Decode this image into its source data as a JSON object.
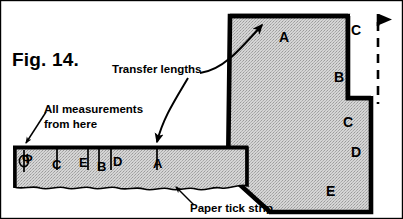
{
  "figure": {
    "title": "Fig. 14.",
    "domain_kind": "technical-illustration"
  },
  "colors": {
    "ink": "#000000",
    "paper": "#ffffff",
    "fill_hatch": "#c9c9c9",
    "fill_strip": "#cfcfcf"
  },
  "annotations": {
    "transfer_lengths": "Transfer lengths",
    "all_measurements": "All measurements",
    "from_here": "from here",
    "paper_tick_strip": "Paper tick strip"
  },
  "tick_strip": {
    "datum_symbol": "Φ",
    "marks": [
      {
        "label": "Φ",
        "x": 24,
        "tick_x": 24,
        "label_x": 22,
        "label_y": 163
      },
      {
        "label": "C",
        "x": 57,
        "tick_x": 57,
        "label_x": 52,
        "label_y": 169
      },
      {
        "label": "E",
        "x": 85,
        "tick_x": 88,
        "label_x": 79,
        "label_y": 167
      },
      {
        "label": "B",
        "x": 99,
        "tick_x": 99,
        "label_x": 97,
        "label_y": 171
      },
      {
        "label": "D",
        "x": 111,
        "tick_x": 111,
        "label_x": 113,
        "label_y": 166
      },
      {
        "label": "A",
        "x": 157,
        "tick_x": 157,
        "label_x": 153,
        "label_y": 168
      }
    ]
  },
  "shape_labels": [
    {
      "label": "A",
      "x": 279,
      "y": 42
    },
    {
      "label": "B",
      "x": 334,
      "y": 82
    },
    {
      "label": "C",
      "x": 351,
      "y": 35
    },
    {
      "label": "C",
      "x": 343,
      "y": 127
    },
    {
      "label": "D",
      "x": 351,
      "y": 157
    },
    {
      "label": "E",
      "x": 326,
      "y": 196
    }
  ],
  "dimension_line": {
    "kind": "dashed-vertical-with-arrowhead",
    "x": 378,
    "top_y": 16,
    "bottom_y": 104
  }
}
